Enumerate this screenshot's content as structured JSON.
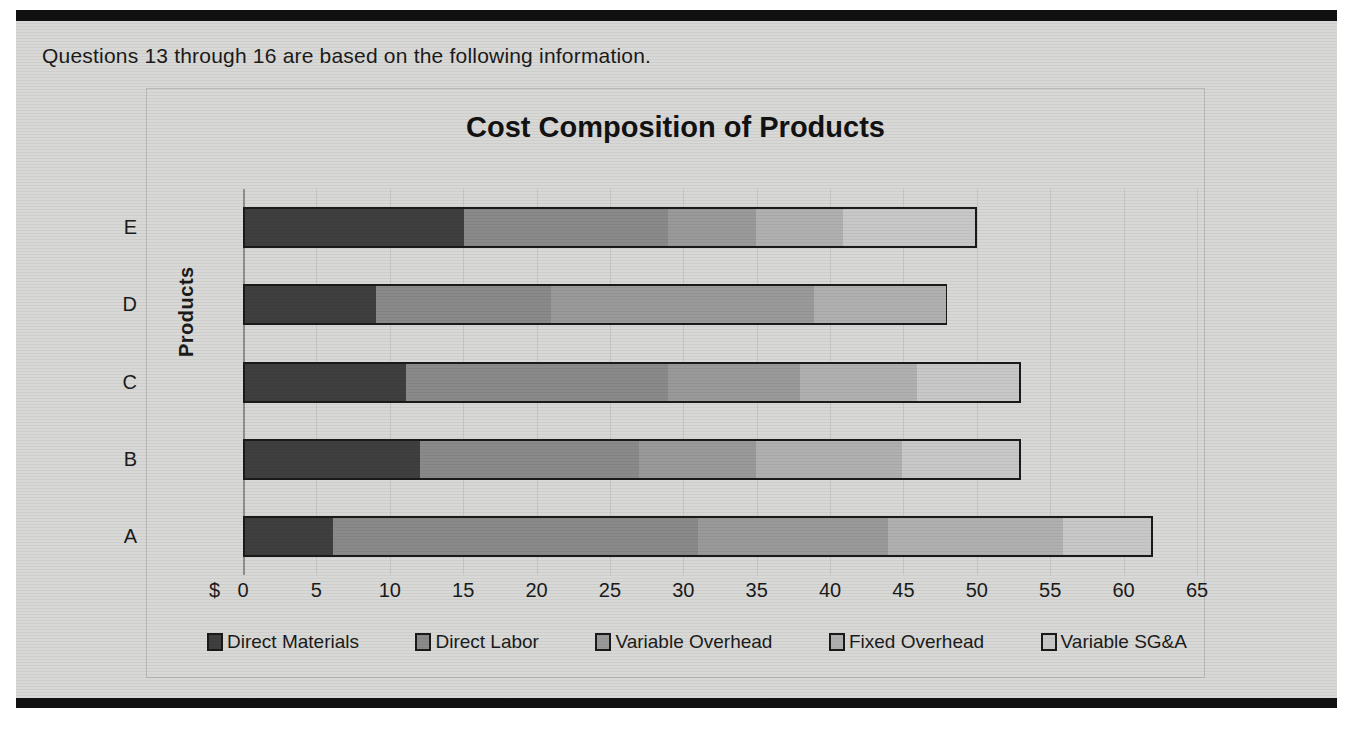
{
  "document": {
    "instruction_text": "Questions 13 through 16 are based on the following information."
  },
  "chart_data": {
    "type": "bar",
    "orientation": "horizontal",
    "stacked": true,
    "title": "Cost Composition of Products",
    "xlabel": "$",
    "ylabel": "Products",
    "categories": [
      "A",
      "B",
      "C",
      "D",
      "E"
    ],
    "display_order_top_to_bottom": [
      "E",
      "D",
      "C",
      "B",
      "A"
    ],
    "xlim": [
      0,
      65
    ],
    "xticks": [
      "0",
      "5",
      "10",
      "15",
      "20",
      "25",
      "30",
      "35",
      "40",
      "45",
      "50",
      "55",
      "60",
      "65"
    ],
    "xtick_prefix": "$",
    "grid": true,
    "legend_position": "bottom",
    "series": [
      {
        "name": "Direct Materials",
        "color": "#3f3f3f",
        "values": [
          6,
          12,
          11,
          9,
          15
        ]
      },
      {
        "name": "Direct Labor",
        "color": "#8a8a8a",
        "values": [
          25,
          15,
          18,
          12,
          14
        ]
      },
      {
        "name": "Variable Overhead",
        "color": "#9a9a9a",
        "values": [
          13,
          8,
          9,
          18,
          6
        ]
      },
      {
        "name": "Fixed Overhead",
        "color": "#b0b0b0",
        "values": [
          12,
          10,
          8,
          9,
          6
        ]
      },
      {
        "name": "Variable SG&A",
        "color": "#c8c8c8",
        "values": [
          6,
          8,
          7,
          0,
          9
        ]
      }
    ],
    "totals": [
      62,
      53,
      53,
      48,
      50
    ]
  },
  "legend": {
    "items": [
      {
        "label": "Direct Materials",
        "color": "#3f3f3f"
      },
      {
        "label": "Direct Labor",
        "color": "#8a8a8a"
      },
      {
        "label": "Variable Overhead",
        "color": "#9a9a9a"
      },
      {
        "label": "Fixed Overhead",
        "color": "#b0b0b0"
      },
      {
        "label": "Variable SG&A",
        "color": "#c8c8c8"
      }
    ]
  },
  "colors": {
    "page_background": "#d8d8d6",
    "rule": "#111111",
    "text": "#1b1b1b",
    "grid": "#c6c6c4",
    "bar_outline": "#1a1a1a"
  }
}
